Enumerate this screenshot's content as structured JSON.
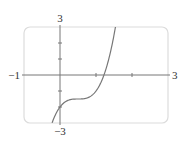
{
  "chart_data": {
    "type": "line",
    "title": "",
    "xlabel": "",
    "ylabel": "",
    "xlim": [
      -1,
      3
    ],
    "ylim": [
      -3,
      3
    ],
    "grid": false,
    "legend": null,
    "x_tick_labels": [
      {
        "value": -1,
        "label": "−1"
      },
      {
        "value": 3,
        "label": "3"
      }
    ],
    "y_tick_labels": [
      {
        "value": 3,
        "label": "3"
      },
      {
        "value": -3,
        "label": "−3"
      }
    ],
    "x_ticks": [
      1,
      2
    ],
    "y_ticks": [
      2,
      1,
      -1,
      -2
    ],
    "series": [
      {
        "name": "f(x)",
        "description": "cubic curve, approximately y = 4(x - 0.5)^3 - 1.5, flat inflection near (0.5, -1.5), y-intercept -2, x-intercept about 1.22",
        "x": [
          -0.22,
          -0.1,
          0.0,
          0.1,
          0.2,
          0.3,
          0.4,
          0.5,
          0.6,
          0.7,
          0.8,
          0.9,
          1.0,
          1.1,
          1.2,
          1.3,
          1.4,
          1.5,
          1.54
        ],
        "y": [
          -3.0,
          -2.36,
          -2.0,
          -1.76,
          -1.61,
          -1.53,
          -1.5,
          -1.5,
          -1.5,
          -1.47,
          -1.39,
          -1.24,
          -1.0,
          -0.64,
          -0.13,
          0.55,
          1.42,
          2.5,
          3.0
        ]
      }
    ]
  },
  "colors": {
    "frame": "#dcdcdc",
    "axis": "#777777",
    "curve": "#777777",
    "label": "#333333"
  }
}
